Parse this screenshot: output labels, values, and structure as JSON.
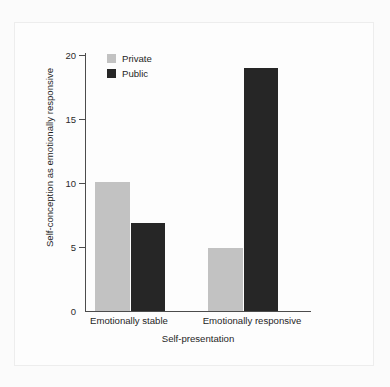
{
  "chart_data": {
    "type": "bar",
    "title": "",
    "subtitle": "",
    "categories": [
      "Emotionally stable",
      "Emotionally responsive"
    ],
    "series": [
      {
        "name": "Private",
        "values": [
          10.1,
          4.9
        ],
        "color": "#c2c2c2"
      },
      {
        "name": "Public",
        "values": [
          6.9,
          19.0
        ],
        "color": "#262626"
      }
    ],
    "xlabel": "Self-presentation",
    "ylabel": "Self-conception as emotionally responsive",
    "ylim": [
      0,
      20
    ],
    "yticks": [
      0,
      5,
      10,
      15,
      20
    ],
    "ytick_labels": [
      "0",
      "5",
      "10",
      "15",
      "20"
    ],
    "grid": false,
    "legend_position": "top-left-inside",
    "legend_entries": [
      "Private",
      "Public"
    ],
    "annotations": []
  },
  "axes": {
    "y_tick_0": "0",
    "y_tick_1": "5",
    "y_tick_2": "10",
    "y_tick_3": "15",
    "y_tick_4": "20",
    "x_label": "Self-presentation",
    "y_label": "Self-conception as emotionally responsive",
    "category_0": "Emotionally stable",
    "category_1": "Emotionally responsive"
  },
  "legend": {
    "private_label": "Private",
    "public_label": "Public"
  },
  "colors": {
    "private": "#c2c2c2",
    "public": "#262626",
    "axis": "#4c4c4c",
    "background": "#fdfdfd"
  }
}
